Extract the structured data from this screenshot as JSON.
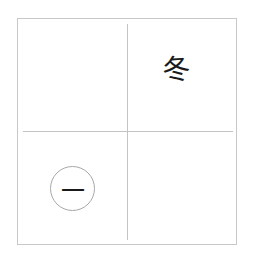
{
  "grid": {
    "top_right": {
      "character": "冬"
    },
    "bottom_left": {
      "character": "一",
      "circled": true
    }
  },
  "colors": {
    "border": "#c8c8c8",
    "divider": "#c4c4c4",
    "text": "#1a1a1a",
    "circle": "#a8a8a8"
  }
}
